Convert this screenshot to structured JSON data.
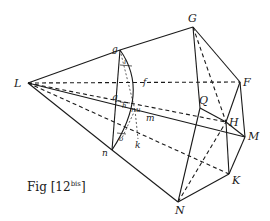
{
  "figure": {
    "caption_main": "Fig [12",
    "caption_sup": "bis",
    "caption_close": "]",
    "labels": {
      "L": "L",
      "G": "G",
      "F": "F",
      "Q": "Q",
      "H": "H",
      "M": "M",
      "K": "K",
      "N": "N",
      "g": "g",
      "f": "f",
      "q": "q",
      "h": "h",
      "i": "i",
      "r": "r",
      "u": "u",
      "m": "m",
      "o": "o",
      "k": "k",
      "n": "n"
    },
    "points": {
      "L": [
        28,
        83
      ],
      "g": [
        120,
        50
      ],
      "G": [
        193,
        27
      ],
      "F": [
        240,
        82
      ],
      "f": [
        146,
        82
      ],
      "q": [
        120,
        97
      ],
      "Q": [
        200,
        108
      ],
      "H": [
        226,
        122
      ],
      "M": [
        245,
        137
      ],
      "K": [
        229,
        174
      ],
      "N": [
        178,
        202
      ],
      "n": [
        112,
        150
      ],
      "k": [
        138,
        139
      ],
      "m": [
        144,
        116
      ]
    },
    "ink_color": "#1a1a1a",
    "background_color": "#ffffff"
  }
}
